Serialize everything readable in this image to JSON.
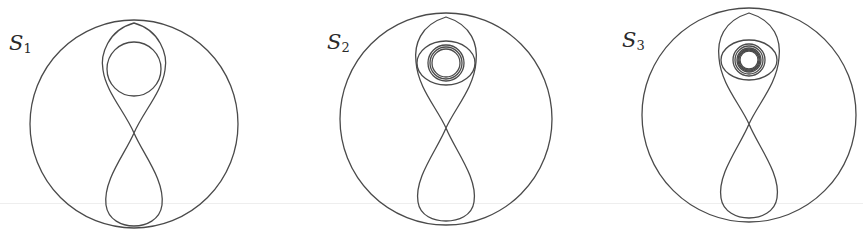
{
  "figure": {
    "stroke_color": "#4a4a4a",
    "background": "#ffffff"
  },
  "panels": [
    {
      "id": "s1",
      "label_main": "S",
      "label_sub": "1",
      "center_x": 134,
      "outer": {
        "cx": 134,
        "cy": 124,
        "r": 104
      },
      "crossing_y": 133,
      "top_loop": {
        "cx": 134,
        "cy": 67,
        "r": 27
      },
      "inner_rings": []
    },
    {
      "id": "s2",
      "label_main": "S",
      "label_sub": "2",
      "center_x": 446,
      "outer": {
        "cx": 446,
        "cy": 119,
        "r": 106
      },
      "crossing_y": 128,
      "top_loop": {
        "cx": 446,
        "cy": 63,
        "r": 24
      },
      "inner_rings": [
        14,
        16,
        18
      ]
    },
    {
      "id": "s3",
      "label_main": "S",
      "label_sub": "3",
      "center_x": 749,
      "outer": {
        "cx": 749,
        "cy": 115,
        "r": 107
      },
      "crossing_y": 124,
      "top_loop": {
        "cx": 749,
        "cy": 60,
        "r": 22
      },
      "inner_rings": [
        9,
        10,
        11,
        12,
        14,
        16
      ]
    }
  ]
}
